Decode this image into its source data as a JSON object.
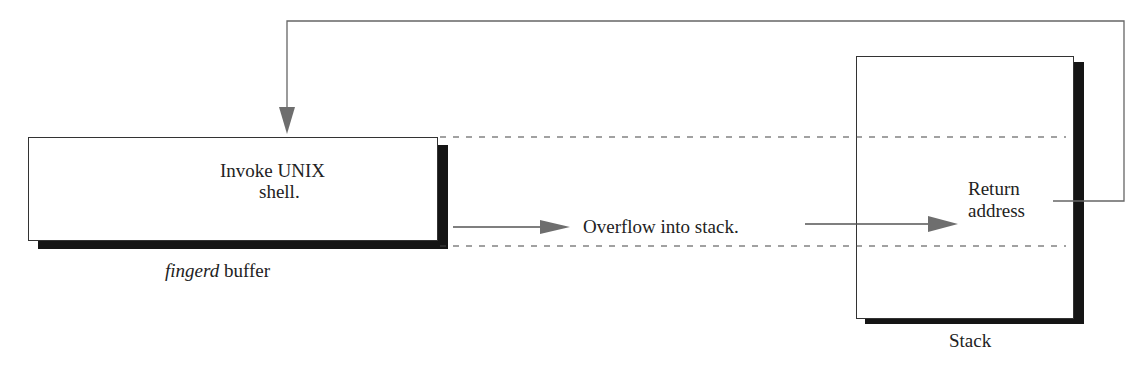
{
  "diagram": {
    "buffer_box": {
      "text_line1": "Invoke UNIX",
      "text_line2": "shell.",
      "caption_italic": "fingerd",
      "caption_rest": " buffer"
    },
    "overflow_label": "Overflow into stack.",
    "stack_box": {
      "return_line1": "Return",
      "return_line2": "address",
      "caption": "Stack"
    },
    "colors": {
      "line": "#555555",
      "arrowhead": "#6e6e6e",
      "shadow": "#151515",
      "border": "#333333"
    }
  }
}
